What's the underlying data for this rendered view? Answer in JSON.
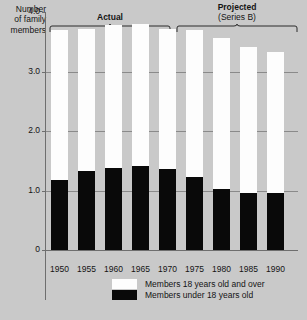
{
  "chart_data": {
    "type": "bar",
    "subtype": "stacked-vertical",
    "title": "",
    "ylabel": "Number of family members",
    "xlabel": "",
    "ylim": [
      0,
      4.0
    ],
    "yticks": [
      "0",
      "1.0",
      "2.0",
      "3.0",
      "4.0"
    ],
    "grid": true,
    "legend_position": "bottom-center",
    "categories": [
      "1950",
      "1955",
      "1960",
      "1965",
      "1970",
      "1975",
      "1980",
      "1985",
      "1990"
    ],
    "series": [
      {
        "name": "Members under 18 years old",
        "color": "#090909",
        "values": [
          1.18,
          1.32,
          1.38,
          1.42,
          1.36,
          1.22,
          1.02,
          0.96,
          0.96
        ]
      },
      {
        "name": "Members 18 years old and over",
        "color": "#fdfdfd",
        "values": [
          2.52,
          2.4,
          2.4,
          2.38,
          2.36,
          2.48,
          2.54,
          2.46,
          2.36
        ]
      }
    ],
    "totals": [
      3.7,
      3.72,
      3.78,
      3.8,
      3.72,
      3.7,
      3.56,
      3.42,
      3.32
    ],
    "annotations": [
      {
        "label": "Actual",
        "sublabel": "",
        "spans": [
          "1950",
          "1970"
        ]
      },
      {
        "label": "Projected",
        "sublabel": "(Series B)",
        "spans": [
          "1975",
          "1990"
        ]
      }
    ]
  },
  "axis": {
    "y_title_line1": "Number",
    "y_title_line2": "of family",
    "y_title_line3": "members",
    "ticks": [
      {
        "value": "4.0"
      },
      {
        "value": "3.0"
      },
      {
        "value": "2.0"
      },
      {
        "value": "1.0"
      },
      {
        "value": "0"
      }
    ],
    "x_labels": [
      "1950",
      "1955",
      "1960",
      "1965",
      "1970",
      "1975",
      "1980",
      "1985",
      "1990"
    ]
  },
  "brackets": {
    "actual": {
      "label": "Actual",
      "sublabel": ""
    },
    "projected": {
      "label": "Projected",
      "sublabel": "(Series B)"
    }
  },
  "legend": {
    "items": [
      {
        "label": "Members 18 years old and over",
        "swatch": "white"
      },
      {
        "label": "Members under 18 years old",
        "swatch": "black"
      }
    ]
  }
}
